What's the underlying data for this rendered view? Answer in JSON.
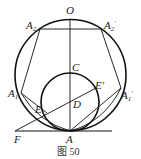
{
  "figure": {
    "caption": "图 50",
    "points": {
      "O": {
        "label": "O",
        "x": 70,
        "y": 14
      },
      "A2": {
        "label": "A",
        "sub": "2",
        "x": 28,
        "y": 28
      },
      "A2p": {
        "label": "A",
        "sub": "2",
        "prime": "′",
        "x": 104,
        "y": 28
      },
      "C": {
        "label": "C",
        "x": 72,
        "y": 70
      },
      "E": {
        "label": "E",
        "x": 36,
        "y": 112
      },
      "Ep": {
        "label": "E",
        "prime": "′",
        "x": 98,
        "y": 90
      },
      "D": {
        "label": "D",
        "x": 73,
        "y": 109
      },
      "A1": {
        "label": "A",
        "sub": "1",
        "x": 8,
        "y": 96
      },
      "A1p": {
        "label": "A",
        "sub": "1",
        "prime": "′",
        "x": 121,
        "y": 98
      },
      "F": {
        "label": "F",
        "x": 14,
        "y": 143
      },
      "A": {
        "label": "A",
        "x": 66,
        "y": 143
      }
    }
  }
}
